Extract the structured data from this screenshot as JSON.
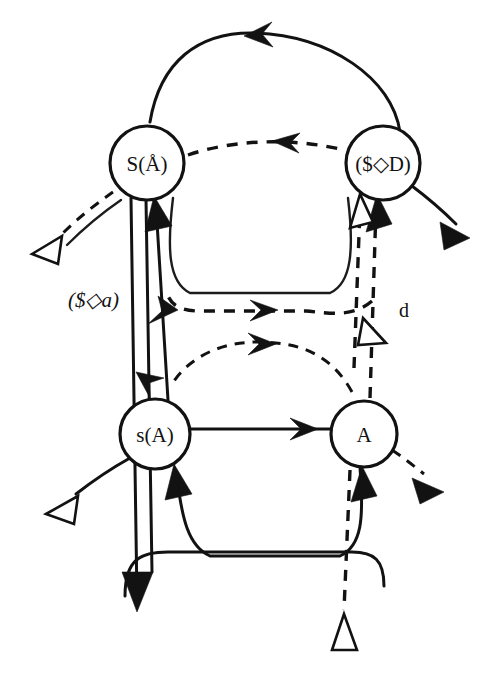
{
  "figure": {
    "type": "directed-graph-diagram",
    "background_color": "#ffffff",
    "ink_color": "#121212",
    "top_caption": "",
    "bottom_caption": ""
  },
  "nodes": [
    {
      "id": "node-s-upper",
      "name": "node-S-A",
      "label": "S(Å)",
      "label_plain": "S(A)",
      "label_prefix": "S(",
      "label_inner": "Å",
      "label_suffix": ")",
      "cx": 147,
      "cy": 163,
      "r": 37
    },
    {
      "id": "node-d-upper",
      "name": "node-dollar-diamond-D",
      "label": "($◇D)",
      "label_plain": "($<>D)",
      "label_prefix": "($",
      "label_inner": "◇",
      "label_suffix": "D)",
      "cx": 383,
      "cy": 163,
      "r": 37
    },
    {
      "id": "node-s-lower",
      "name": "node-s-A",
      "label": "s(A)",
      "label_plain": "s(A)",
      "label_prefix": "s",
      "label_inner": "(A",
      "label_suffix": ")",
      "cx": 155,
      "cy": 434,
      "r": 35
    },
    {
      "id": "node-a-lower",
      "name": "node-A",
      "label": "A",
      "label_plain": "A",
      "label_prefix": "",
      "label_inner": "A",
      "label_suffix": "",
      "cx": 364,
      "cy": 434,
      "r": 33
    }
  ],
  "edge_labels": [
    {
      "id": "label-s-diamond-a",
      "name": "edge-label-dollar-diamond-a",
      "text": "($◇a)",
      "text_plain": "($<>a)",
      "x": 68,
      "y": 300,
      "style": "italic"
    },
    {
      "id": "label-d",
      "name": "edge-label-d",
      "text": "d",
      "text_plain": "d",
      "x": 399,
      "y": 310,
      "style": "roman"
    }
  ],
  "edges": [
    {
      "id": "e1",
      "name": "edge-top-arc-right-to-left",
      "style": "solid",
      "arrowhead": "solid",
      "from": "node-d-upper",
      "to": "node-s-upper"
    },
    {
      "id": "e2",
      "name": "edge-top-dashed-left-to-right",
      "style": "dashed",
      "arrowhead": "solid",
      "from": "node-s-upper",
      "to": "node-d-upper"
    },
    {
      "id": "e3",
      "name": "edge-upper-trough-solid",
      "style": "solid",
      "arrowhead": "none",
      "from": "node-s-upper",
      "to": "node-d-upper"
    },
    {
      "id": "e4",
      "name": "edge-mid-dashed-right-to-left",
      "style": "dashed",
      "arrowhead": "solid",
      "from": "node-d-upper",
      "to": "node-s-upper"
    },
    {
      "id": "e5",
      "name": "edge-lower-mid-dashed-right-to-left",
      "style": "dashed",
      "arrowhead": "solid",
      "from": "node-a-lower",
      "to": "node-s-lower"
    },
    {
      "id": "e6",
      "name": "edge-vertical-double-down",
      "style": "solid-double",
      "arrowhead": "solid",
      "from": "node-s-upper",
      "to": "node-s-lower"
    },
    {
      "id": "e7",
      "name": "edge-vertical-up-to-S",
      "style": "solid",
      "arrowhead": "solid",
      "from": "node-s-lower",
      "to": "node-s-upper"
    },
    {
      "id": "e8",
      "name": "edge-vertical-dashed-right-pair",
      "style": "dashed",
      "arrowhead": "solid",
      "from": "node-a-lower",
      "to": "node-d-upper"
    },
    {
      "id": "e9",
      "name": "edge-vertical-dashed-hollow-head",
      "style": "dashed",
      "arrowhead": "hollow",
      "from": "node-a-lower",
      "to": "node-d-upper"
    },
    {
      "id": "e10",
      "name": "edge-bottom-horizontal-solid",
      "style": "solid",
      "arrowhead": "solid",
      "from": "node-s-lower",
      "to": "node-a-lower"
    },
    {
      "id": "e11",
      "name": "edge-bottom-trough-solid",
      "style": "solid",
      "arrowhead": "solid",
      "from": "node-a-lower",
      "to": "node-s-lower"
    },
    {
      "id": "e12",
      "name": "edge-exit-upper-left-dashed",
      "style": "dashed",
      "arrowhead": "hollow",
      "from": "node-s-upper",
      "to": "external"
    },
    {
      "id": "e13",
      "name": "edge-exit-upper-left-solid",
      "style": "solid",
      "arrowhead": "hollow",
      "from": "node-s-upper",
      "to": "external"
    },
    {
      "id": "e14",
      "name": "edge-exit-upper-right-solid",
      "style": "solid",
      "arrowhead": "solid",
      "from": "node-d-upper",
      "to": "external"
    },
    {
      "id": "e15",
      "name": "edge-exit-lower-left-solid",
      "style": "solid",
      "arrowhead": "hollow",
      "from": "node-s-lower",
      "to": "external"
    },
    {
      "id": "e16",
      "name": "edge-exit-lower-right-dashed",
      "style": "dashed",
      "arrowhead": "solid",
      "from": "node-a-lower",
      "to": "external"
    },
    {
      "id": "e17",
      "name": "edge-exit-bottom-down-solid",
      "style": "solid",
      "arrowhead": "solid",
      "from": "node-s-lower",
      "to": "external"
    },
    {
      "id": "e18",
      "name": "edge-entry-bottom-dashed",
      "style": "dashed",
      "arrowhead": "hollow",
      "from": "external",
      "to": "node-a-lower"
    },
    {
      "id": "e19",
      "name": "edge-mid-hollow-head-right",
      "style": "solid",
      "arrowhead": "hollow",
      "from": "node-d-upper",
      "to": "external"
    }
  ]
}
